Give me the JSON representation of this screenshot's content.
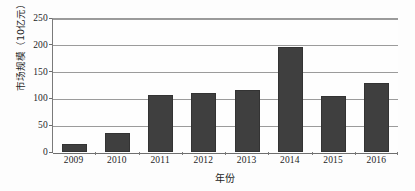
{
  "chart_data": {
    "type": "bar",
    "title": "",
    "categories": [
      "2009",
      "2010",
      "2011",
      "2012",
      "2013",
      "2014",
      "2015",
      "2016"
    ],
    "values": [
      15,
      35,
      106,
      111,
      116,
      196,
      105,
      128
    ],
    "xlabel": "年份",
    "ylabel": "市场规模（10亿元）",
    "ylim": [
      0,
      250
    ],
    "yticks": [
      0,
      50,
      100,
      150,
      200,
      250
    ],
    "ytick_labels": [
      "0",
      "50",
      "100",
      "150",
      "200",
      "250"
    ],
    "grid": true,
    "legend": "none",
    "bar_color": "#3f3f3f",
    "gridline_color": "#9b9b9b",
    "axis_color": "#6e6e6e",
    "background_color": "#fdfdfd"
  }
}
